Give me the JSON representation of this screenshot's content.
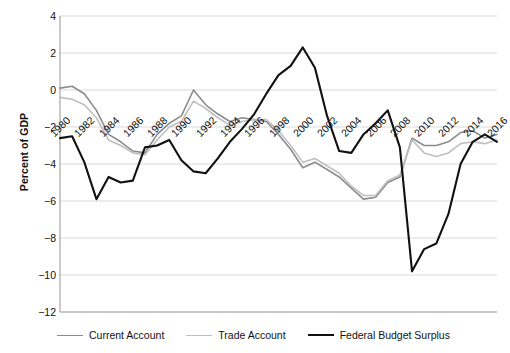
{
  "chart_data": {
    "type": "line",
    "title": "",
    "xlabel": "",
    "ylabel": "Percent of GDP",
    "ylim": [
      -12,
      4
    ],
    "ystep": 2,
    "ytick_labels": [
      "4",
      "2",
      "0",
      "−2",
      "−4",
      "−6",
      "−8",
      "−10",
      "−12"
    ],
    "xlim": [
      1980,
      2016
    ],
    "xtick_labels": [
      "1980",
      "1982",
      "1984",
      "1986",
      "1988",
      "1990",
      "1992",
      "1994",
      "1996",
      "1998",
      "2000",
      "2002",
      "2004",
      "2006",
      "2008",
      "2010",
      "2012",
      "2014",
      "2016"
    ],
    "x": [
      1980,
      1981,
      1982,
      1983,
      1984,
      1985,
      1986,
      1987,
      1988,
      1989,
      1990,
      1991,
      1992,
      1993,
      1994,
      1995,
      1996,
      1997,
      1998,
      1999,
      2000,
      2001,
      2002,
      2003,
      2004,
      2005,
      2006,
      2007,
      2008,
      2009,
      2010,
      2011,
      2012,
      2013,
      2014,
      2015,
      2016
    ],
    "grid": true,
    "legend_position": "bottom",
    "series": [
      {
        "name": "Current Account",
        "color": "#8c8c8c",
        "width": 1.6,
        "values": [
          0.1,
          0.2,
          -0.2,
          -1.1,
          -2.4,
          -2.8,
          -3.3,
          -3.4,
          -2.4,
          -1.8,
          -1.4,
          0.0,
          -0.8,
          -1.3,
          -1.7,
          -1.5,
          -1.6,
          -1.7,
          -2.4,
          -3.2,
          -4.2,
          -3.9,
          -4.3,
          -4.7,
          -5.3,
          -5.9,
          -5.8,
          -5.0,
          -4.7,
          -2.6,
          -3.0,
          -3.0,
          -2.8,
          -2.3,
          -2.2,
          -2.6,
          -2.4
        ]
      },
      {
        "name": "Trade Account",
        "color": "#bfbfbf",
        "width": 1.6,
        "values": [
          -0.4,
          -0.5,
          -0.8,
          -1.5,
          -2.7,
          -3.0,
          -3.4,
          -3.5,
          -2.7,
          -2.0,
          -1.7,
          -0.6,
          -1.0,
          -1.5,
          -1.9,
          -1.7,
          -1.6,
          -1.6,
          -2.2,
          -3.0,
          -3.9,
          -3.7,
          -4.1,
          -4.5,
          -5.2,
          -5.7,
          -5.7,
          -4.9,
          -4.6,
          -2.7,
          -3.4,
          -3.6,
          -3.4,
          -2.9,
          -2.8,
          -2.9,
          -2.7
        ]
      },
      {
        "name": "Federal Budget Surplus",
        "color": "#111111",
        "width": 2.1,
        "values": [
          -2.6,
          -2.5,
          -3.9,
          -5.9,
          -4.7,
          -5.0,
          -4.9,
          -3.1,
          -3.0,
          -2.7,
          -3.8,
          -4.4,
          -4.5,
          -3.7,
          -2.8,
          -2.1,
          -1.3,
          -0.2,
          0.8,
          1.3,
          2.3,
          1.2,
          -1.4,
          -3.3,
          -3.4,
          -2.4,
          -1.8,
          -1.1,
          -3.1,
          -9.8,
          -8.6,
          -8.3,
          -6.7,
          -4.0,
          -2.8,
          -2.4,
          -2.8
        ]
      }
    ]
  },
  "legend": {
    "items": [
      {
        "label": "Current Account",
        "color": "#8c8c8c",
        "width": "1.6px"
      },
      {
        "label": "Trade Account",
        "color": "#bfbfbf",
        "width": "1.6px"
      },
      {
        "label": "Federal Budget Surplus",
        "color": "#111111",
        "width": "2.3px"
      }
    ]
  },
  "axis": {
    "axis_color": "#a6a6a6",
    "grid_color": "#d9d9d9"
  }
}
